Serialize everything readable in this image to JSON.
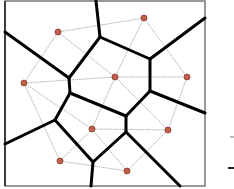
{
  "diagram": {
    "frame": {
      "x": 5,
      "y": 1,
      "width": 200,
      "height": 185
    },
    "colors": {
      "voronoi_edge": "#000000",
      "delaunay_edge": "#9a9a9a",
      "site_fill": "#c0604a",
      "frame": "#777777"
    },
    "sites": [
      {
        "id": "s1",
        "x": 58,
        "y": 32
      },
      {
        "id": "s2",
        "x": 144,
        "y": 18
      },
      {
        "id": "s3",
        "x": 24,
        "y": 83
      },
      {
        "id": "s4",
        "x": 115,
        "y": 77
      },
      {
        "id": "s5",
        "x": 187,
        "y": 77
      },
      {
        "id": "s6",
        "x": 92,
        "y": 129
      },
      {
        "id": "s7",
        "x": 168,
        "y": 130
      },
      {
        "id": "s8",
        "x": 60,
        "y": 161
      },
      {
        "id": "s9",
        "x": 127,
        "y": 171
      }
    ],
    "voronoi_edges": [
      [
        96,
        1,
        100,
        37
      ],
      [
        100,
        37,
        150,
        59
      ],
      [
        100,
        37,
        69,
        78
      ],
      [
        5,
        32,
        69,
        78
      ],
      [
        150,
        59,
        205,
        18
      ],
      [
        150,
        59,
        150,
        91
      ],
      [
        150,
        91,
        205,
        113
      ],
      [
        150,
        91,
        126,
        116
      ],
      [
        69,
        78,
        70,
        93
      ],
      [
        70,
        93,
        126,
        116
      ],
      [
        70,
        93,
        55,
        120
      ],
      [
        55,
        120,
        5,
        144
      ],
      [
        55,
        120,
        93,
        162
      ],
      [
        126,
        116,
        126,
        132
      ],
      [
        126,
        132,
        93,
        162
      ],
      [
        126,
        132,
        180,
        186
      ],
      [
        93,
        162,
        91,
        186
      ]
    ],
    "delaunay_edges": [
      [
        "s1",
        "s2"
      ],
      [
        "s1",
        "s3"
      ],
      [
        "s1",
        "s4"
      ],
      [
        "s2",
        "s4"
      ],
      [
        "s2",
        "s5"
      ],
      [
        "s3",
        "s4"
      ],
      [
        "s3",
        "s6"
      ],
      [
        "s3",
        "s8"
      ],
      [
        "s4",
        "s5"
      ],
      [
        "s4",
        "s6"
      ],
      [
        "s4",
        "s7"
      ],
      [
        "s5",
        "s7"
      ],
      [
        "s6",
        "s7"
      ],
      [
        "s6",
        "s8"
      ],
      [
        "s6",
        "s9"
      ],
      [
        "s7",
        "s9"
      ],
      [
        "s8",
        "s9"
      ]
    ],
    "side_marks": [
      {
        "x": 230,
        "y": 136,
        "width": 4,
        "color": "#bbbbbb"
      },
      {
        "x": 228,
        "y": 167,
        "width": 6,
        "color": "#222222"
      }
    ]
  }
}
